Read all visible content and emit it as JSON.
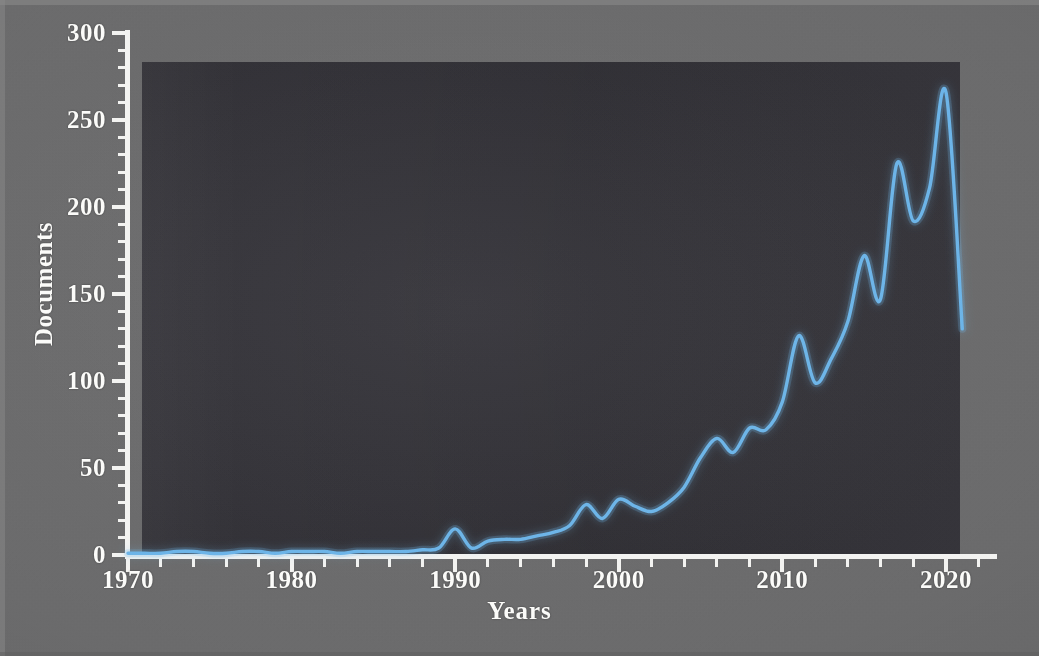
{
  "figure": {
    "background_color": "#6b6b6c",
    "plot_background_color": "#343339",
    "axis_color": "#f3f3f1",
    "line_color": "#6cb4e8"
  },
  "chart_data": {
    "type": "line",
    "title": "",
    "subtitle": "",
    "xlabel": "Years",
    "ylabel": "Documents",
    "xlim": [
      1970,
      2023
    ],
    "ylim": [
      0,
      300
    ],
    "x_major_ticks": [
      1970,
      1980,
      1990,
      2000,
      2010,
      2020
    ],
    "x_tick_labels": [
      "1970",
      "1980",
      "1990",
      "2000",
      "2010",
      "2020"
    ],
    "x_minor_tick_step": 2,
    "y_major_ticks": [
      0,
      50,
      100,
      150,
      200,
      250,
      300
    ],
    "y_tick_labels": [
      "0",
      "50",
      "100",
      "150",
      "200",
      "250",
      "300"
    ],
    "y_minor_tick_step": 10,
    "grid": false,
    "legend": null,
    "annotations": [],
    "series": [
      {
        "name": "Documents",
        "color": "#6cb4e8",
        "line_width": 3,
        "smoothing": "spline",
        "x": [
          1970,
          1971,
          1972,
          1973,
          1974,
          1975,
          1976,
          1977,
          1978,
          1979,
          1980,
          1981,
          1982,
          1983,
          1984,
          1985,
          1986,
          1987,
          1988,
          1989,
          1990,
          1991,
          1992,
          1993,
          1994,
          1995,
          1996,
          1997,
          1998,
          1999,
          2000,
          2001,
          2002,
          2003,
          2004,
          2005,
          2006,
          2007,
          2008,
          2009,
          2010,
          2011,
          2012,
          2013,
          2014,
          2015,
          2016,
          2017,
          2018,
          2019,
          2020,
          2021
        ],
        "y": [
          1,
          1,
          1,
          2,
          2,
          1,
          1,
          2,
          2,
          1,
          2,
          2,
          2,
          1,
          2,
          2,
          2,
          2,
          3,
          4,
          15,
          4,
          8,
          9,
          9,
          11,
          13,
          17,
          29,
          21,
          32,
          28,
          25,
          30,
          39,
          56,
          67,
          59,
          73,
          72,
          88,
          126,
          99,
          113,
          134,
          172,
          147,
          225,
          192,
          211,
          266,
          130
        ]
      }
    ]
  }
}
